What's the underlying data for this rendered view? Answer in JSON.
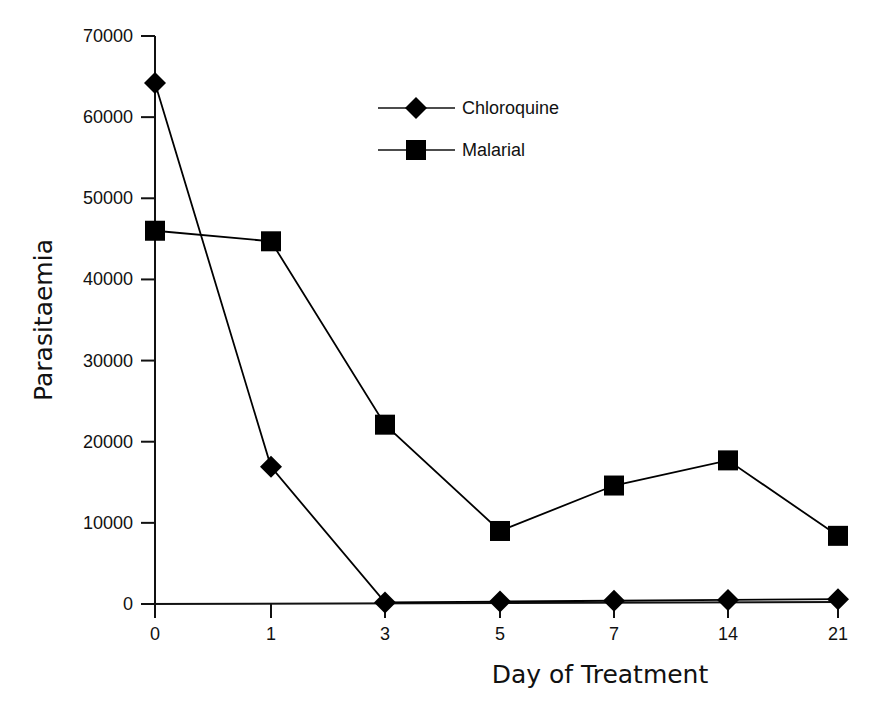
{
  "chart_data": {
    "type": "line",
    "title": "",
    "xlabel": "Day of Treatment",
    "ylabel": "Parasitaemia",
    "categories": [
      "0",
      "1",
      "3",
      "5",
      "7",
      "14",
      "21"
    ],
    "ylim": [
      0,
      70000
    ],
    "yticks": [
      0,
      10000,
      20000,
      30000,
      40000,
      50000,
      60000,
      70000
    ],
    "grid": false,
    "legend_position": "upper center",
    "series": [
      {
        "name": "Chloroquine",
        "marker": "diamond",
        "color": "#000000",
        "values": [
          64200,
          16900,
          200,
          300,
          400,
          500,
          600
        ]
      },
      {
        "name": "Malarial",
        "marker": "square",
        "color": "#000000",
        "values": [
          46000,
          44700,
          22100,
          9000,
          14600,
          17700,
          8400
        ]
      }
    ]
  }
}
